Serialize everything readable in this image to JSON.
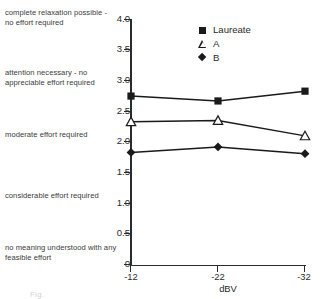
{
  "figure": {
    "anchor_labels": [
      "complete relaxation possible - no effort required",
      "attention necessary - no appreciable effort required",
      "moderate effort required",
      "considerable effort required",
      "no meaning understood with any feasible effort"
    ],
    "caption_remnant": "Fig."
  },
  "chart_data": {
    "type": "line",
    "title": "",
    "xlabel": "dBV",
    "ylabel": "",
    "categories": [
      "-12",
      "-22",
      "-32"
    ],
    "x": [
      -12,
      -22,
      -32
    ],
    "series": [
      {
        "name": "Laureate",
        "marker": "filled-square",
        "values": [
          2.75,
          2.67,
          2.83
        ]
      },
      {
        "name": "A",
        "marker": "open-triangle",
        "values": [
          2.33,
          2.35,
          2.1
        ]
      },
      {
        "name": "B",
        "marker": "filled-diamond",
        "values": [
          1.83,
          1.92,
          1.81
        ]
      }
    ],
    "ylim": [
      0,
      4.0
    ],
    "ytick_labels": [
      "4.0",
      "3.5",
      "3.0",
      "2.5",
      "2.0",
      "1.5",
      "1.0",
      "0.5",
      "0"
    ],
    "ytick_values": [
      4.0,
      3.5,
      3.0,
      2.5,
      2.0,
      1.5,
      1.0,
      0.5,
      0
    ],
    "xtick_labels": [
      "-12",
      "-22",
      "-32"
    ],
    "grid": false,
    "legend_position": "top-right",
    "scale_anchors": [
      {
        "label": "complete relaxation possible - no effort required",
        "level": 4
      },
      {
        "label": "attention necessary - no appreciable effort required",
        "level": 3
      },
      {
        "label": "moderate effort required",
        "level": 2
      },
      {
        "label": "considerable effort required",
        "level": 1
      },
      {
        "label": "no meaning understood with any feasible effort",
        "level": 0
      }
    ],
    "colors": {
      "ink": "#231f20",
      "axis": "#2b2b2b",
      "marker": "#1a1a1a"
    }
  }
}
